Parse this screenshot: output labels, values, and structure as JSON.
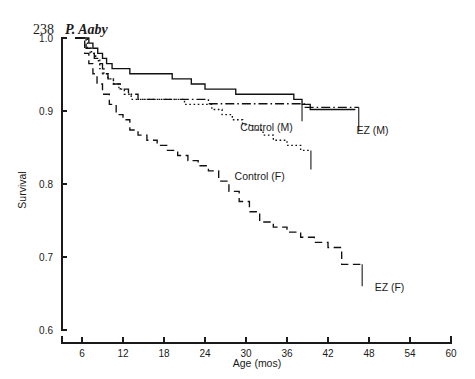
{
  "page": {
    "folio": "238",
    "author": "P. Aaby"
  },
  "chart_data": {
    "type": "line",
    "title": "",
    "xlabel": "Age (mos)",
    "ylabel": "Survival",
    "xlim": [
      4,
      60
    ],
    "ylim": [
      0.6,
      1.0
    ],
    "xticks": [
      6,
      12,
      18,
      24,
      30,
      36,
      42,
      48,
      54,
      60
    ],
    "yticks": [
      0.6,
      0.7,
      0.8,
      0.9,
      1.0
    ],
    "ytick_labels": [
      "0.6",
      "0.7",
      "0.8",
      "0.9",
      "1.0"
    ],
    "xtick_labels": [
      "6",
      "12",
      "18",
      "24",
      "30",
      "36",
      "42",
      "48",
      "54",
      "60"
    ],
    "grid": false,
    "legend_position": "inline-annotations",
    "step_type": "post",
    "series": [
      {
        "name": "Control (M)",
        "dash": "solid",
        "label": "Control (M)",
        "label_x": 33.0,
        "label_y": 0.872,
        "x": [
          5.0,
          6.2,
          7.0,
          7.6,
          8.3,
          9.0,
          9.6,
          10.4,
          11.2,
          12.0,
          13.0,
          14.5,
          16.0,
          18.0,
          19.2,
          20.5,
          22.0,
          24.0,
          26.5,
          28.5,
          31.0,
          33.5,
          35.5,
          37.0,
          38.2,
          39.4,
          40.6,
          41.8,
          43.5,
          46.0
        ],
        "y": [
          1.0,
          1.0,
          0.993,
          0.986,
          0.979,
          0.972,
          0.965,
          0.958,
          0.958,
          0.958,
          0.951,
          0.951,
          0.951,
          0.951,
          0.944,
          0.944,
          0.937,
          0.93,
          0.93,
          0.923,
          0.923,
          0.923,
          0.923,
          0.916,
          0.909,
          0.902,
          0.902,
          0.902,
          0.902,
          0.902
        ]
      },
      {
        "name": "Control (F)",
        "dash": "dotted",
        "label": "Control (F)",
        "label_x": 32.0,
        "label_y": 0.805,
        "x": [
          5.0,
          6.0,
          6.8,
          7.4,
          8.0,
          8.6,
          9.2,
          9.8,
          10.6,
          11.4,
          12.2,
          13.2,
          14.4,
          15.8,
          17.4,
          19.0,
          21.0,
          23.0,
          25.0,
          26.5,
          28.0,
          29.5,
          31.0,
          32.5,
          34.0,
          36.0,
          38.0,
          39.5
        ],
        "y": [
          1.0,
          1.0,
          0.986,
          0.979,
          0.972,
          0.958,
          0.951,
          0.944,
          0.937,
          0.93,
          0.923,
          0.916,
          0.916,
          0.916,
          0.916,
          0.916,
          0.909,
          0.909,
          0.902,
          0.895,
          0.888,
          0.881,
          0.874,
          0.867,
          0.86,
          0.853,
          0.846,
          0.846
        ]
      },
      {
        "name": "EZ (M)",
        "dash": "dashdot",
        "label": "EZ (M)",
        "label_x": 48.5,
        "label_y": 0.868,
        "x": [
          5.0,
          6.0,
          6.6,
          7.2,
          7.8,
          8.4,
          9.0,
          9.8,
          10.6,
          11.6,
          12.8,
          14.2,
          16.0,
          18.0,
          20.0,
          22.0,
          24.5,
          27.0,
          30.0,
          33.0,
          36.0,
          38.5,
          40.5,
          43.0,
          46.5
        ],
        "y": [
          1.0,
          1.0,
          0.986,
          0.979,
          0.972,
          0.965,
          0.951,
          0.944,
          0.937,
          0.93,
          0.923,
          0.916,
          0.916,
          0.916,
          0.916,
          0.916,
          0.91,
          0.91,
          0.91,
          0.91,
          0.91,
          0.905,
          0.905,
          0.905,
          0.905
        ]
      },
      {
        "name": "EZ (F)",
        "dash": "longdash",
        "label": "EZ (F)",
        "label_x": 51.0,
        "label_y": 0.653,
        "x": [
          5.0,
          5.8,
          6.4,
          7.0,
          7.6,
          8.2,
          9.0,
          10.0,
          11.0,
          12.0,
          13.0,
          14.2,
          15.5,
          17.0,
          18.5,
          20.0,
          21.5,
          23.0,
          24.5,
          26.0,
          27.5,
          29.0,
          30.5,
          32.0,
          34.0,
          36.0,
          38.0,
          40.0,
          42.0,
          44.0,
          47.0
        ],
        "y": [
          1.0,
          1.0,
          0.979,
          0.965,
          0.951,
          0.937,
          0.923,
          0.909,
          0.895,
          0.888,
          0.874,
          0.867,
          0.86,
          0.853,
          0.846,
          0.839,
          0.832,
          0.825,
          0.818,
          0.804,
          0.79,
          0.776,
          0.762,
          0.748,
          0.741,
          0.734,
          0.727,
          0.72,
          0.713,
          0.69,
          0.69
        ]
      }
    ],
    "annotations": [
      {
        "name": "ez-m-leader",
        "x": 46.5,
        "y_top": 0.905,
        "y_bottom": 0.872
      },
      {
        "name": "ez-f-leader",
        "x": 47.0,
        "y_top": 0.69,
        "y_bottom": 0.66
      },
      {
        "name": "control-m-leader",
        "x": 38.2,
        "y_top": 0.909,
        "y_bottom": 0.886
      },
      {
        "name": "control-f-leader",
        "x": 39.5,
        "y_top": 0.846,
        "y_bottom": 0.82
      }
    ]
  }
}
